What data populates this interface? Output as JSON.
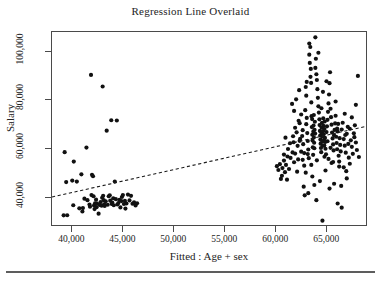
{
  "figure": {
    "title": "Regression Line Overlaid",
    "page_rule": "horizontal-rule"
  },
  "chart_data": {
    "type": "scatter",
    "title": "Regression Line Overlaid",
    "xlabel": "Fitted : Age + sex",
    "ylabel": "Salary",
    "xlim": [
      38000,
      69000
    ],
    "ylim": [
      28000,
      108000
    ],
    "grid": false,
    "legend": null,
    "xticks": [
      40000,
      45000,
      50000,
      55000,
      60000,
      65000
    ],
    "xticklabels": [
      "40,000",
      "45,000",
      "50,000",
      "55,000",
      "60,000",
      "65,000"
    ],
    "yticks": [
      40000,
      60000,
      80000,
      100000
    ],
    "yticklabels": [
      "40,000",
      "60,000",
      "80,000",
      "100,000"
    ],
    "marker": "filled-circle",
    "marker_color": "#111111",
    "marker_size": 2.1,
    "regression_line": {
      "style": "dashed",
      "color": "#1a1a1a",
      "x_start": 38000,
      "y_start": 39600,
      "x_end": 69000,
      "y_end": 68900
    },
    "series": [
      {
        "name": "Salary vs Fitted",
        "points": [
          [
            39150,
            32000
          ],
          [
            39500,
            32050
          ],
          [
            39250,
            58200
          ],
          [
            39400,
            45800
          ],
          [
            40000,
            46400
          ],
          [
            40150,
            54300
          ],
          [
            40100,
            36200
          ],
          [
            40450,
            46000
          ],
          [
            40700,
            34900
          ],
          [
            41050,
            35000
          ],
          [
            41200,
            38900
          ],
          [
            41000,
            33600
          ],
          [
            41400,
            60100
          ],
          [
            41500,
            38300
          ],
          [
            41850,
            90200
          ],
          [
            41700,
            36500
          ],
          [
            41750,
            35600
          ],
          [
            41900,
            40400
          ],
          [
            41950,
            48800
          ],
          [
            42050,
            48200
          ],
          [
            42150,
            36100
          ],
          [
            42100,
            39900
          ],
          [
            42250,
            37000
          ],
          [
            42200,
            34600
          ],
          [
            42350,
            38500
          ],
          [
            42450,
            36900
          ],
          [
            42400,
            35400
          ],
          [
            42600,
            32700
          ],
          [
            42700,
            36300
          ],
          [
            42800,
            37500
          ],
          [
            42900,
            36000
          ],
          [
            42950,
            39300
          ],
          [
            43000,
            85400
          ],
          [
            43050,
            40100
          ],
          [
            43100,
            38300
          ],
          [
            43150,
            36600
          ],
          [
            43200,
            35900
          ],
          [
            43300,
            37800
          ],
          [
            43400,
            67100
          ],
          [
            43500,
            36400
          ],
          [
            43600,
            39900
          ],
          [
            43700,
            40300
          ],
          [
            43750,
            38100
          ],
          [
            43850,
            71400
          ],
          [
            43900,
            36700
          ],
          [
            43950,
            37300
          ],
          [
            44050,
            39100
          ],
          [
            44100,
            36200
          ],
          [
            44200,
            46000
          ],
          [
            44300,
            38700
          ],
          [
            44400,
            71300
          ],
          [
            44450,
            36500
          ],
          [
            44550,
            37100
          ],
          [
            44650,
            38400
          ],
          [
            44750,
            35300
          ],
          [
            44850,
            37900
          ],
          [
            44900,
            39600
          ],
          [
            45000,
            40400
          ],
          [
            45100,
            36700
          ],
          [
            45200,
            38000
          ],
          [
            45250,
            34800
          ],
          [
            45350,
            36900
          ],
          [
            45500,
            40600
          ],
          [
            45650,
            38200
          ],
          [
            45800,
            40100
          ],
          [
            45950,
            36800
          ],
          [
            46100,
            37400
          ],
          [
            46250,
            36100
          ],
          [
            46400,
            37000
          ],
          [
            40900,
            49000
          ],
          [
            60200,
            52400
          ],
          [
            60350,
            50800
          ],
          [
            60500,
            53200
          ],
          [
            60600,
            47100
          ],
          [
            60750,
            51600
          ],
          [
            60900,
            54700
          ],
          [
            61000,
            49900
          ],
          [
            61100,
            52900
          ],
          [
            61250,
            56400
          ],
          [
            61400,
            51200
          ],
          [
            61550,
            55800
          ],
          [
            61700,
            78200
          ],
          [
            61750,
            58100
          ],
          [
            61850,
            62300
          ],
          [
            61900,
            54000
          ],
          [
            62000,
            57600
          ],
          [
            62100,
            80100
          ],
          [
            62150,
            66400
          ],
          [
            62250,
            60800
          ],
          [
            62300,
            55200
          ],
          [
            62400,
            83900
          ],
          [
            62450,
            70200
          ],
          [
            62500,
            63700
          ],
          [
            62600,
            58400
          ],
          [
            62700,
            64900
          ],
          [
            62750,
            67300
          ],
          [
            62800,
            61500
          ],
          [
            62900,
            57800
          ],
          [
            62950,
            40300
          ],
          [
            63000,
            75600
          ],
          [
            63050,
            85200
          ],
          [
            63100,
            69800
          ],
          [
            63150,
            72400
          ],
          [
            63200,
            66100
          ],
          [
            63250,
            62800
          ],
          [
            63300,
            59300
          ],
          [
            63350,
            55700
          ],
          [
            63400,
            98600
          ],
          [
            63450,
            95200
          ],
          [
            63500,
            101800
          ],
          [
            63520,
            89400
          ],
          [
            63550,
            92700
          ],
          [
            63580,
            86900
          ],
          [
            63600,
            78800
          ],
          [
            63620,
            73100
          ],
          [
            63650,
            68600
          ],
          [
            63680,
            71900
          ],
          [
            63700,
            65400
          ],
          [
            63720,
            63000
          ],
          [
            63750,
            60200
          ],
          [
            63780,
            57100
          ],
          [
            63800,
            66700
          ],
          [
            63820,
            69200
          ],
          [
            63850,
            64300
          ],
          [
            63880,
            62100
          ],
          [
            63900,
            59800
          ],
          [
            63920,
            67500
          ],
          [
            63950,
            70800
          ],
          [
            63980,
            65900
          ],
          [
            64000,
            105800
          ],
          [
            64050,
            96900
          ],
          [
            64100,
            90500
          ],
          [
            64150,
            88100
          ],
          [
            64200,
            84300
          ],
          [
            64250,
            80700
          ],
          [
            64300,
            77200
          ],
          [
            64350,
            74600
          ],
          [
            64400,
            71800
          ],
          [
            64420,
            69400
          ],
          [
            64450,
            67000
          ],
          [
            64480,
            65100
          ],
          [
            64500,
            63400
          ],
          [
            64520,
            61700
          ],
          [
            64550,
            59900
          ],
          [
            64580,
            58200
          ],
          [
            64600,
            66200
          ],
          [
            64620,
            68400
          ],
          [
            64650,
            70300
          ],
          [
            64680,
            64700
          ],
          [
            64700,
            62600
          ],
          [
            64720,
            60800
          ],
          [
            64750,
            66900
          ],
          [
            64780,
            72200
          ],
          [
            64800,
            69100
          ],
          [
            64820,
            65600
          ],
          [
            64850,
            63200
          ],
          [
            64880,
            61000
          ],
          [
            64900,
            67800
          ],
          [
            64920,
            70900
          ],
          [
            64950,
            64100
          ],
          [
            64980,
            62400
          ],
          [
            65000,
            59600
          ],
          [
            65050,
            57300
          ],
          [
            65100,
            66500
          ],
          [
            65150,
            68900
          ],
          [
            65200,
            71600
          ],
          [
            65250,
            74900
          ],
          [
            65300,
            78400
          ],
          [
            65350,
            82100
          ],
          [
            65400,
            86800
          ],
          [
            65450,
            91300
          ],
          [
            65500,
            76200
          ],
          [
            65550,
            72700
          ],
          [
            65600,
            69600
          ],
          [
            65650,
            66300
          ],
          [
            65700,
            63900
          ],
          [
            65750,
            61400
          ],
          [
            65800,
            58900
          ],
          [
            65850,
            65200
          ],
          [
            65900,
            67400
          ],
          [
            65950,
            70100
          ],
          [
            66000,
            73300
          ],
          [
            66050,
            64600
          ],
          [
            66100,
            62000
          ],
          [
            66150,
            59400
          ],
          [
            66200,
            66800
          ],
          [
            66250,
            69900
          ],
          [
            66300,
            56700
          ],
          [
            66350,
            54300
          ],
          [
            66400,
            64000
          ],
          [
            66450,
            61200
          ],
          [
            66500,
            58500
          ],
          [
            66600,
            67600
          ],
          [
            66700,
            70400
          ],
          [
            66800,
            63600
          ],
          [
            66900,
            60900
          ],
          [
            67000,
            58000
          ],
          [
            67100,
            65800
          ],
          [
            67200,
            68700
          ],
          [
            67300,
            55900
          ],
          [
            67400,
            53400
          ],
          [
            67500,
            63100
          ],
          [
            67600,
            60400
          ],
          [
            67700,
            57500
          ],
          [
            67800,
            66000
          ],
          [
            67900,
            69300
          ],
          [
            68000,
            62200
          ],
          [
            68100,
            59100
          ],
          [
            68200,
            89800
          ],
          [
            68300,
            56200
          ],
          [
            62850,
            43900
          ],
          [
            63300,
            41200
          ],
          [
            63900,
            44600
          ],
          [
            64100,
            38300
          ],
          [
            64700,
            29800
          ],
          [
            65400,
            43100
          ],
          [
            66200,
            36900
          ],
          [
            66600,
            35200
          ],
          [
            67100,
            47300
          ],
          [
            61200,
            46800
          ],
          [
            60700,
            48400
          ],
          [
            62200,
            50100
          ],
          [
            63600,
            52900
          ],
          [
            65000,
            50600
          ],
          [
            66800,
            51900
          ],
          [
            67400,
            67900
          ],
          [
            62600,
            73800
          ],
          [
            61900,
            75300
          ],
          [
            63100,
            81600
          ],
          [
            64000,
            93100
          ],
          [
            64300,
            99400
          ],
          [
            63400,
            103200
          ],
          [
            65100,
            87600
          ],
          [
            66000,
            79200
          ],
          [
            66900,
            74100
          ],
          [
            67600,
            72600
          ],
          [
            68000,
            77800
          ],
          [
            61500,
            61900
          ],
          [
            62000,
            68300
          ],
          [
            62750,
            55000
          ],
          [
            63250,
            57400
          ],
          [
            64150,
            54800
          ],
          [
            65600,
            53700
          ],
          [
            66350,
            52200
          ],
          [
            67050,
            50300
          ],
          [
            60900,
            57200
          ],
          [
            61300,
            59500
          ],
          [
            61800,
            64800
          ],
          [
            62350,
            71200
          ],
          [
            62900,
            52600
          ],
          [
            63050,
            49700
          ],
          [
            63700,
            48100
          ],
          [
            64450,
            46200
          ],
          [
            65850,
            45100
          ],
          [
            66550,
            44200
          ],
          [
            64900,
            56300
          ],
          [
            65300,
            55400
          ],
          [
            65750,
            54100
          ],
          [
            66150,
            68000
          ],
          [
            66950,
            65300
          ],
          [
            63850,
            73600
          ],
          [
            64600,
            76400
          ],
          [
            65200,
            62700
          ],
          [
            65500,
            60000
          ],
          [
            62450,
            62900
          ],
          [
            61050,
            64200
          ],
          [
            67250,
            61600
          ],
          [
            67850,
            64400
          ],
          [
            63150,
            87300
          ],
          [
            64750,
            83200
          ]
        ]
      }
    ]
  },
  "axes": {
    "y_ticks": [
      {
        "label": "100,000",
        "value": 100000
      },
      {
        "label": "80,000",
        "value": 80000
      },
      {
        "label": "60,000",
        "value": 60000
      },
      {
        "label": "40,000",
        "value": 40000
      }
    ],
    "x_ticks": [
      {
        "label": "40,000",
        "value": 40000
      },
      {
        "label": "45,000",
        "value": 45000
      },
      {
        "label": "50,000",
        "value": 50000
      },
      {
        "label": "55,000",
        "value": 55000
      },
      {
        "label": "60,000",
        "value": 60000
      },
      {
        "label": "65,000",
        "value": 65000
      }
    ],
    "y_title": "Salary",
    "x_title": "Fitted : Age + sex"
  }
}
